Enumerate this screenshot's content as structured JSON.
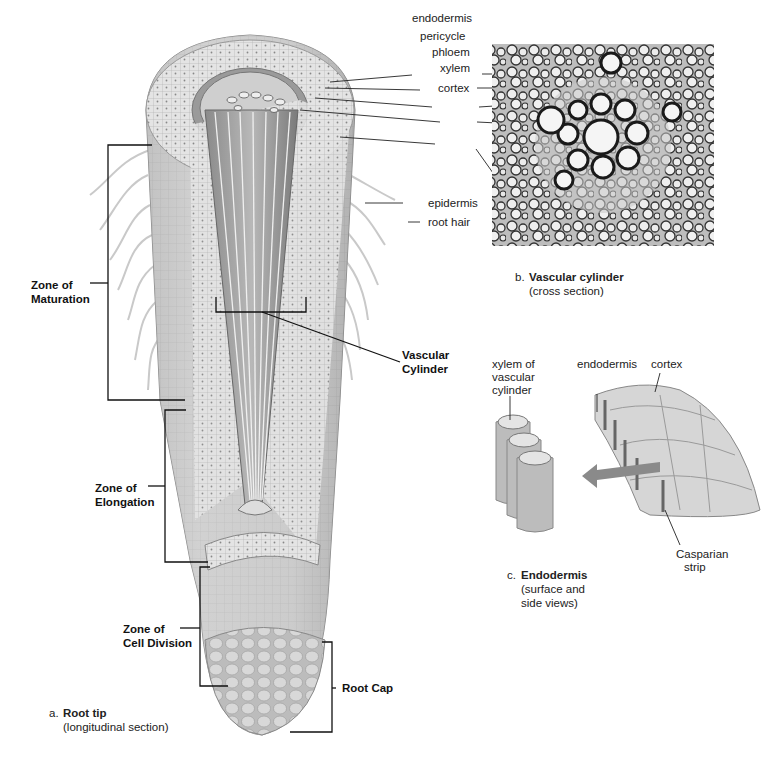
{
  "figure": {
    "panel_a": {
      "letter": "a.",
      "title": "Root tip",
      "subtitle": "(longitudinal section)",
      "zones": [
        {
          "line1": "Zone of",
          "line2": "Maturation"
        },
        {
          "line1": "Zone of",
          "line2": "Elongation"
        },
        {
          "line1": "Zone of",
          "line2": "Cell Division"
        }
      ],
      "root_cap": "Root Cap",
      "vascular_cylinder": {
        "line1": "Vascular",
        "line2": "Cylinder"
      },
      "callouts": [
        "endodermis",
        "pericycle",
        "phloem",
        "xylem",
        "cortex",
        "epidermis",
        "root hair"
      ]
    },
    "panel_b": {
      "letter": "b.",
      "title": "Vascular cylinder",
      "subtitle": "(cross section)"
    },
    "panel_c": {
      "letter": "c.",
      "title": "Endodermis",
      "subtitle_line1": "(surface and",
      "subtitle_line2": "side views)",
      "labels": {
        "xylem1": "xylem of",
        "xylem2": "vascular",
        "xylem3": "cylinder",
        "endodermis": "endodermis",
        "cortex": "cortex",
        "casparian1": "Casparian",
        "casparian2": "strip"
      }
    }
  }
}
